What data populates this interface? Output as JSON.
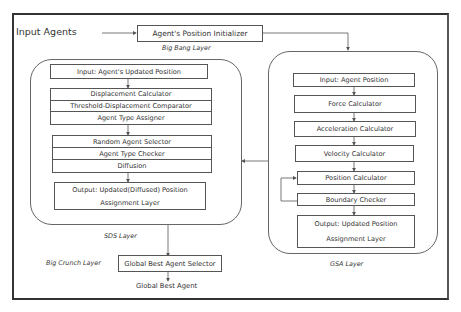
{
  "title_input": "Input Agents",
  "big_bang": {
    "box": "Agent's Position Initializer",
    "caption": "Big Bang Layer"
  },
  "sds_layer": {
    "caption": "SDS Layer",
    "input": "Input: Agent's Updated Position",
    "group1": [
      "Displacement Calculator",
      "Threshold-Displacement Comparator",
      "Agent Type Assigner"
    ],
    "group2": [
      "Random Agent Selector",
      "Agent Type Checker",
      "Diffusion"
    ],
    "output": [
      "Output: Updated(Diffused) Position",
      "Assignment Layer"
    ]
  },
  "gsa_layer": {
    "caption": "GSA Layer",
    "input": "Input: Agent Position",
    "steps": [
      "Force Calculator",
      "Acceleration Calculator",
      "Velocity Calculator",
      "Position Calculator",
      "Boundary Checker"
    ],
    "output": [
      "Output: Updated Position",
      "Assignment Layer"
    ]
  },
  "big_crunch": {
    "caption": "Big Crunch Layer",
    "box": "Global Best Agent Selector",
    "result": "Global Best Agent"
  }
}
